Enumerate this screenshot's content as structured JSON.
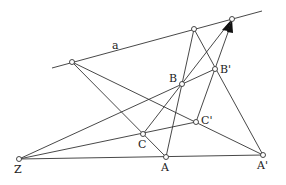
{
  "labels": {
    "a": "a",
    "B": "B",
    "Bp": "B'",
    "C": "C",
    "Cp": "C'",
    "Z": "Z",
    "A": "A",
    "Ap": "A'"
  },
  "colors": {
    "line": "#333333",
    "point_fill": "#ffffff"
  }
}
